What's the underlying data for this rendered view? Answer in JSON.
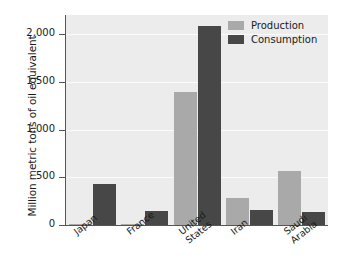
{
  "chart_data": {
    "type": "bar",
    "title": "",
    "xlabel": "",
    "ylabel": "Million metric tons of oil equivalent",
    "categories": [
      "Japan",
      "France",
      "United\nStates",
      "Iran",
      "Saudi\nArabia"
    ],
    "ylim": [
      0,
      2200
    ],
    "yticks": [
      0,
      500,
      1000,
      1500,
      2000
    ],
    "ytick_labels": [
      "0",
      "500",
      "1,000",
      "1,500",
      "2,000"
    ],
    "grid": true,
    "legend_position": "top-right",
    "series": [
      {
        "name": "Production",
        "color": "#a9a9a9",
        "values": [
          10,
          12,
          1390,
          285,
          565
        ]
      },
      {
        "name": "Consumption",
        "color": "#474747",
        "values": [
          430,
          150,
          2080,
          155,
          140
        ]
      }
    ]
  },
  "colors": {
    "plot_background": "#ececec",
    "gridline": "#fbfbfb",
    "axis": "#555555",
    "production": "#a9a9a9",
    "consumption": "#474747"
  }
}
